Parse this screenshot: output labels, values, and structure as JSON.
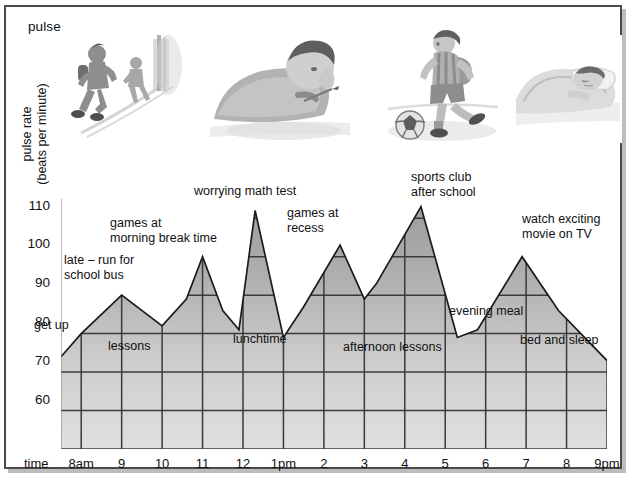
{
  "title": "pulse rate chart",
  "axes": {
    "y_label": "pulse rate\n(beats per minute)",
    "y_label_line1": "pulse rate",
    "y_label_line2": "(beats per minute)",
    "x_label": "time",
    "y_ticks": [
      "110",
      "100",
      "90",
      "80",
      "70",
      "60"
    ],
    "x_ticks": [
      "8am",
      "9",
      "10",
      "11",
      "12",
      "1pm",
      "2",
      "3",
      "4",
      "5",
      "6",
      "7",
      "8",
      "9pm"
    ]
  },
  "annotations": {
    "get_up": "get up",
    "late_run": "late – run for\nschool bus",
    "games_break": "games at\nmorning break time",
    "worrying_test": "worrying math test",
    "games_recess": "games at\nrecess",
    "sports_club": "sports club\nafter school",
    "watch_tv": "watch exciting\nmovie on TV",
    "lessons": "lessons",
    "lunchtime": "lunchtime",
    "afternoon_lessons": "afternoon lessons",
    "evening_meal": "evening meal",
    "bed_sleep": "bed and sleep"
  },
  "illustrations": [
    {
      "name": "running-for-bus-sketch",
      "caption": "child running for the school bus"
    },
    {
      "name": "writing-test-sketch",
      "caption": "child worrying over a math test"
    },
    {
      "name": "playing-soccer-sketch",
      "caption": "child playing soccer at sports club"
    },
    {
      "name": "sleeping-in-bed-sketch",
      "caption": "child asleep in bed"
    }
  ],
  "colors": {
    "fill_top": "#9d9d9d",
    "fill_bottom": "#dcdcdc",
    "line": "#1c1c1c",
    "grid": "#3a3a3a",
    "frame": "#4a4a4a"
  },
  "chart_data": {
    "type": "area",
    "title": "pulse rate chart",
    "xlabel": "time",
    "ylabel": "pulse rate (beats per minute)",
    "xlim": [
      7.5,
      21.0
    ],
    "ylim": [
      50,
      115
    ],
    "yticks": [
      60,
      70,
      80,
      90,
      100,
      110
    ],
    "grid": true,
    "legend": false,
    "x_tick_labels": [
      "8am",
      "9",
      "10",
      "11",
      "12",
      "1pm",
      "2",
      "3",
      "4",
      "5",
      "6",
      "7",
      "8",
      "9pm"
    ],
    "x_tick_hours": [
      8,
      9,
      10,
      11,
      12,
      13,
      14,
      15,
      16,
      17,
      18,
      19,
      20,
      21
    ],
    "x": [
      7.5,
      8.0,
      9.0,
      10.0,
      10.6,
      11.0,
      11.5,
      11.9,
      12.3,
      13.0,
      13.5,
      14.4,
      15.0,
      15.3,
      16.4,
      17.3,
      17.8,
      18.9,
      19.8,
      21.0
    ],
    "y": [
      74,
      80,
      90,
      82,
      89,
      100,
      86,
      81,
      112,
      79,
      87,
      103,
      89,
      93,
      113,
      79,
      81,
      100,
      86,
      73
    ],
    "points": [
      {
        "time": "7:30am",
        "hour": 7.5,
        "pulse": 74,
        "event": "get up"
      },
      {
        "time": "8am",
        "hour": 8.0,
        "pulse": 80,
        "event": "get up"
      },
      {
        "time": "9am",
        "hour": 9.0,
        "pulse": 90,
        "event": "late – run for school bus"
      },
      {
        "time": "10am",
        "hour": 10.0,
        "pulse": 82,
        "event": "lessons"
      },
      {
        "time": "10:36am",
        "hour": 10.6,
        "pulse": 89,
        "event": "lessons"
      },
      {
        "time": "11am",
        "hour": 11.0,
        "pulse": 100,
        "event": "games at morning break time"
      },
      {
        "time": "11:30am",
        "hour": 11.5,
        "pulse": 86,
        "event": "lessons"
      },
      {
        "time": "11:54am",
        "hour": 11.9,
        "pulse": 81,
        "event": "lessons"
      },
      {
        "time": "12:18pm",
        "hour": 12.3,
        "pulse": 112,
        "event": "worrying math test"
      },
      {
        "time": "1pm",
        "hour": 13.0,
        "pulse": 79,
        "event": "lunchtime"
      },
      {
        "time": "1:30pm",
        "hour": 13.5,
        "pulse": 87,
        "event": "lunchtime"
      },
      {
        "time": "2:24pm",
        "hour": 14.4,
        "pulse": 103,
        "event": "games at recess"
      },
      {
        "time": "3pm",
        "hour": 15.0,
        "pulse": 89,
        "event": "afternoon lessons"
      },
      {
        "time": "3:18pm",
        "hour": 15.3,
        "pulse": 93,
        "event": "afternoon lessons"
      },
      {
        "time": "4:24pm",
        "hour": 16.4,
        "pulse": 113,
        "event": "sports club after school"
      },
      {
        "time": "5:18pm",
        "hour": 17.3,
        "pulse": 79,
        "event": "evening meal"
      },
      {
        "time": "5:48pm",
        "hour": 17.8,
        "pulse": 81,
        "event": "evening meal"
      },
      {
        "time": "6:54pm",
        "hour": 18.9,
        "pulse": 100,
        "event": "watch exciting movie on TV"
      },
      {
        "time": "7:48pm",
        "hour": 19.8,
        "pulse": 86,
        "event": "bed and sleep"
      },
      {
        "time": "9pm",
        "hour": 21.0,
        "pulse": 73,
        "event": "bed and sleep"
      }
    ]
  }
}
